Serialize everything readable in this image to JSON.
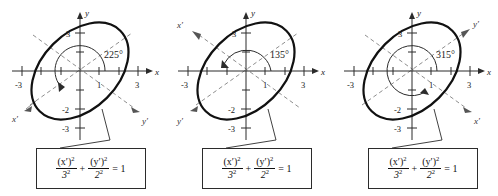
{
  "figure": {
    "background_color": "#ffffff",
    "curve_color": "#111111",
    "axis_color": "#2b2b2b",
    "prime_axis_color": "#8e8e8e"
  },
  "equation": {
    "x_numerator": "(x′)",
    "x_num_exp": "2",
    "x_denominator": "3",
    "x_den_exp": "2",
    "plus": "+",
    "y_numerator": "(y′)",
    "y_num_exp": "2",
    "y_denominator": "2",
    "y_den_exp": "2",
    "equals": "= 1"
  },
  "panels": [
    {
      "id": "panel-1",
      "angle_label": "225°",
      "angle_degrees": 225,
      "x_axis_label": "x",
      "y_axis_label": "y",
      "x_prime_label": "x′",
      "y_prime_label": "y′",
      "x_prime_position": "lower-left",
      "y_prime_position": "lower-right",
      "x_ticks": [
        "-3",
        "1",
        "3"
      ],
      "y_ticks": [
        "3",
        "-2",
        "-3"
      ],
      "ellipse": {
        "semi_major": 3,
        "semi_minor": 2,
        "rotation_deg": 45
      }
    },
    {
      "id": "panel-2",
      "angle_label": "135°",
      "angle_degrees": 135,
      "x_axis_label": "x",
      "y_axis_label": "y",
      "x_prime_label": "x′",
      "y_prime_label": "y′",
      "x_prime_position": "upper-left",
      "y_prime_position": "lower-left",
      "x_ticks": [
        "-3",
        "1",
        "3"
      ],
      "y_ticks": [
        "3",
        "-2",
        "-3"
      ],
      "ellipse": {
        "semi_major": 3,
        "semi_minor": 2,
        "rotation_deg": 45
      }
    },
    {
      "id": "panel-3",
      "angle_label": "315°",
      "angle_degrees": 315,
      "x_axis_label": "x",
      "y_axis_label": "y",
      "x_prime_label": "x′",
      "y_prime_label": "y′",
      "x_prime_position": "lower-right",
      "y_prime_position": "upper-right",
      "x_ticks": [
        "-3",
        "1",
        "3"
      ],
      "y_ticks": [
        "3",
        "-2",
        "-3"
      ],
      "ellipse": {
        "semi_major": 3,
        "semi_minor": 2,
        "rotation_deg": 45
      }
    }
  ]
}
